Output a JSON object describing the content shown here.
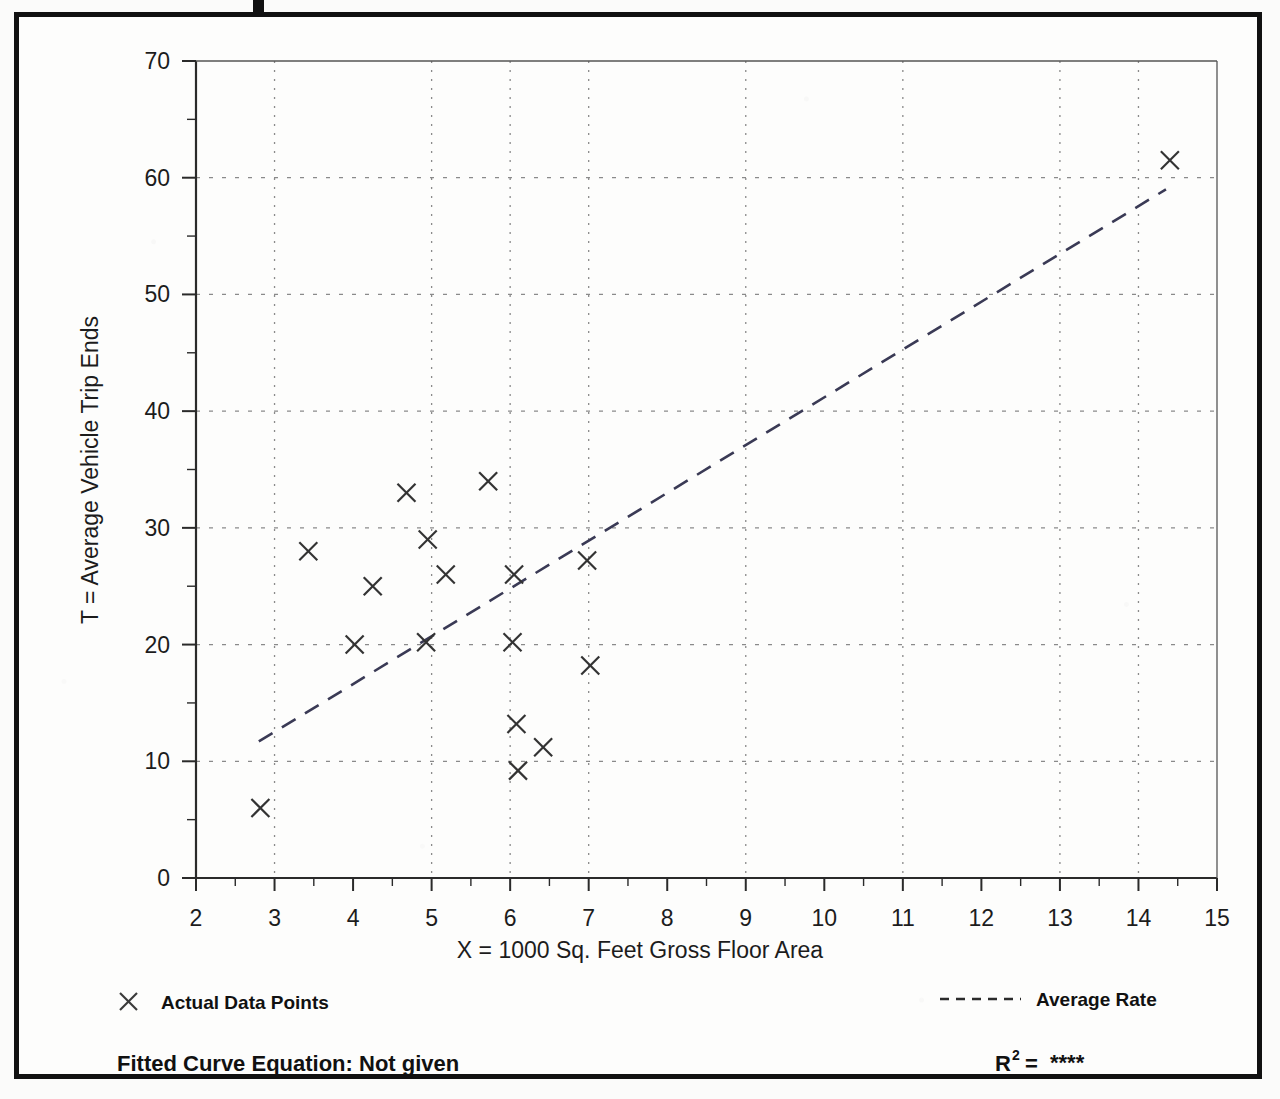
{
  "figure": {
    "background_color": "#fdfdfc",
    "frame_color": "#111111",
    "ink_color": "#1c1c1c",
    "grid_color": "#8a8a8a"
  },
  "legend": {
    "marker_icon": "x-marker-icon",
    "data_points_label": "Actual Data Points",
    "line_icon": "dashed-line-icon",
    "average_rate_label": "Average Rate"
  },
  "footer": {
    "equation_label": "Fitted Curve Equation:  Not given",
    "r_squared_base": "R",
    "r_squared_exponent": "2",
    "r_squared_equals": "=",
    "r_squared_value": "****"
  },
  "chart_data": {
    "type": "scatter",
    "title": "",
    "xlabel": "X = 1000 Sq. Feet Gross Floor Area",
    "ylabel": "T = Average Vehicle Trip Ends",
    "xlim": [
      2,
      15
    ],
    "ylim": [
      0,
      70
    ],
    "xticks": [
      2,
      3,
      4,
      5,
      6,
      7,
      8,
      9,
      10,
      11,
      12,
      13,
      14,
      15
    ],
    "xtick_labels": [
      "2",
      "3",
      "4",
      "5",
      "6",
      "7",
      "8",
      "9",
      "10",
      "11",
      "12",
      "13",
      "14",
      "15"
    ],
    "yticks": [
      0,
      10,
      20,
      30,
      40,
      50,
      60,
      70
    ],
    "ytick_labels": [
      "0",
      "10",
      "20",
      "30",
      "40",
      "50",
      "60",
      "70"
    ],
    "x_minor_tick_step": 0.5,
    "y_minor_tick_step": 5,
    "grid": true,
    "grid_style": "dotted",
    "grid_x_values": [
      3,
      5,
      6,
      7,
      9,
      11,
      13,
      14
    ],
    "grid_y_values": [
      10,
      20,
      30,
      40,
      50,
      60
    ],
    "legend_position": "below-axes",
    "series": [
      {
        "name": "Actual Data Points",
        "type": "scatter",
        "marker": "x",
        "points": [
          {
            "x": 2.82,
            "y": 6.0
          },
          {
            "x": 3.43,
            "y": 28.0
          },
          {
            "x": 4.02,
            "y": 20.0
          },
          {
            "x": 4.25,
            "y": 25.0
          },
          {
            "x": 4.68,
            "y": 33.0
          },
          {
            "x": 4.93,
            "y": 20.2
          },
          {
            "x": 4.95,
            "y": 29.0
          },
          {
            "x": 5.18,
            "y": 26.0
          },
          {
            "x": 5.72,
            "y": 34.0
          },
          {
            "x": 6.03,
            "y": 20.2
          },
          {
            "x": 6.05,
            "y": 26.0
          },
          {
            "x": 6.08,
            "y": 13.2
          },
          {
            "x": 6.1,
            "y": 9.2
          },
          {
            "x": 6.42,
            "y": 11.2
          },
          {
            "x": 6.98,
            "y": 27.2
          },
          {
            "x": 7.02,
            "y": 18.2
          },
          {
            "x": 14.4,
            "y": 61.5
          }
        ]
      },
      {
        "name": "Average Rate",
        "type": "line",
        "style": "dashed",
        "x": [
          2.8,
          14.35
        ],
        "y": [
          11.7,
          59.0
        ]
      }
    ]
  }
}
